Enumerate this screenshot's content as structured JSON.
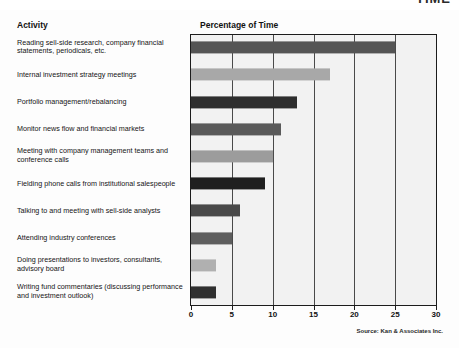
{
  "page": {
    "cut_off_title": "TIME"
  },
  "headers": {
    "activity": "Activity",
    "percentage": "Percentage of Time"
  },
  "source_note": "Source: Kan & Associates Inc.",
  "chart_data": {
    "type": "bar",
    "orientation": "horizontal",
    "title": "Percentage of Time",
    "xlabel": "",
    "ylabel": "Activity",
    "xlim": [
      0,
      30
    ],
    "xticks": [
      0,
      5,
      10,
      15,
      20,
      25,
      30
    ],
    "xtick_labels": [
      "0",
      "5",
      "10",
      "15",
      "20",
      "25",
      "30"
    ],
    "grid": true,
    "legend": "none",
    "categories": [
      "Reading sell-side research, company financial statements, periodicals, etc.",
      "Internal investment strategy meetings",
      "Portfolio management/rebalancing",
      "Monitor news flow and financial markets",
      "Meeting with company management teams and conference calls",
      "Fielding phone calls from institutional salespeople",
      "Talking to and meeting with sell-side analysts",
      "Attending industry conferences",
      "Doing presentations to investors, consultants, advisory board",
      "Writing fund commentaries (discussing performance and investment outlook)"
    ],
    "values": [
      25,
      17,
      13,
      11,
      10,
      9,
      6,
      5,
      3,
      3
    ],
    "bar_colors": [
      "#555555",
      "#a8a8a8",
      "#2e2e2e",
      "#5a5a5a",
      "#9c9c9c",
      "#1f1f1f",
      "#4a4a4a",
      "#5e5e5e",
      "#b0b0b0",
      "#303030"
    ]
  }
}
